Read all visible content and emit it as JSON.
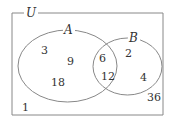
{
  "diagram": {
    "type": "venn",
    "universe": {
      "label": "U",
      "outside_elements": [
        "1",
        "36"
      ]
    },
    "sets": [
      {
        "label": "A",
        "only_elements": [
          "3",
          "9",
          "18"
        ]
      },
      {
        "label": "B",
        "only_elements": [
          "2",
          "4"
        ]
      }
    ],
    "intersection": {
      "elements": [
        "6",
        "12"
      ]
    },
    "labels": {
      "U": "U",
      "A": "A",
      "B": "B",
      "n3": "3",
      "n9": "9",
      "n18": "18",
      "n6": "6",
      "n12": "12",
      "n2": "2",
      "n4": "4",
      "n1": "1",
      "n36": "36"
    },
    "colors": {
      "line": "#888888",
      "text": "#333333",
      "background": "#ffffff"
    }
  }
}
